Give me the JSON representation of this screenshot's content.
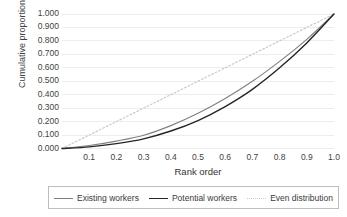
{
  "chart_data": {
    "type": "line",
    "title": "",
    "xlabel": "Rank order",
    "ylabel": "Cumulative proportion",
    "xlim": [
      0.0,
      1.0
    ],
    "ylim": [
      0.0,
      1.0
    ],
    "grid": true,
    "legend_position": "bottom",
    "x_ticks": [
      "0.1",
      "0.2",
      "0.3",
      "0.4",
      "0.5",
      "0.6",
      "0.7",
      "0.8",
      "0.9",
      "1.0"
    ],
    "x_tick_values": [
      0.1,
      0.2,
      0.3,
      0.4,
      0.5,
      0.6,
      0.7,
      0.8,
      0.9,
      1.0
    ],
    "y_ticks": [
      "1.000",
      "0.900",
      "0.800",
      "0.700",
      "0.600",
      "0.500",
      "0.400",
      "0.300",
      "0.200",
      "0.100",
      "0.000"
    ],
    "y_tick_values": [
      1.0,
      0.9,
      0.8,
      0.7,
      0.6,
      0.5,
      0.4,
      0.3,
      0.2,
      0.1,
      0.0
    ],
    "x": [
      0.0,
      0.1,
      0.2,
      0.3,
      0.4,
      0.5,
      0.6,
      0.7,
      0.8,
      0.9,
      1.0
    ],
    "series": [
      {
        "name": "Existing workers",
        "color": "#808080",
        "style": "solid",
        "width": 1.1,
        "values": [
          0.0,
          0.022,
          0.055,
          0.098,
          0.17,
          0.262,
          0.372,
          0.5,
          0.648,
          0.812,
          1.0
        ]
      },
      {
        "name": "Potential workers",
        "color": "#262626",
        "style": "solid",
        "width": 1.4,
        "values": [
          0.0,
          0.012,
          0.036,
          0.072,
          0.13,
          0.208,
          0.312,
          0.44,
          0.6,
          0.785,
          1.0
        ]
      },
      {
        "name": "Even distribution",
        "color": "#c9c9c9",
        "style": "dotted",
        "width": 1.2,
        "values": [
          0.0,
          0.1,
          0.2,
          0.3,
          0.4,
          0.5,
          0.6,
          0.7,
          0.8,
          0.9,
          1.0
        ]
      }
    ]
  },
  "colors": {
    "gridline": "#ededed",
    "axis_text": "#3f3f3f",
    "legend_border": "#bdbdbd",
    "background": "#ffffff"
  }
}
